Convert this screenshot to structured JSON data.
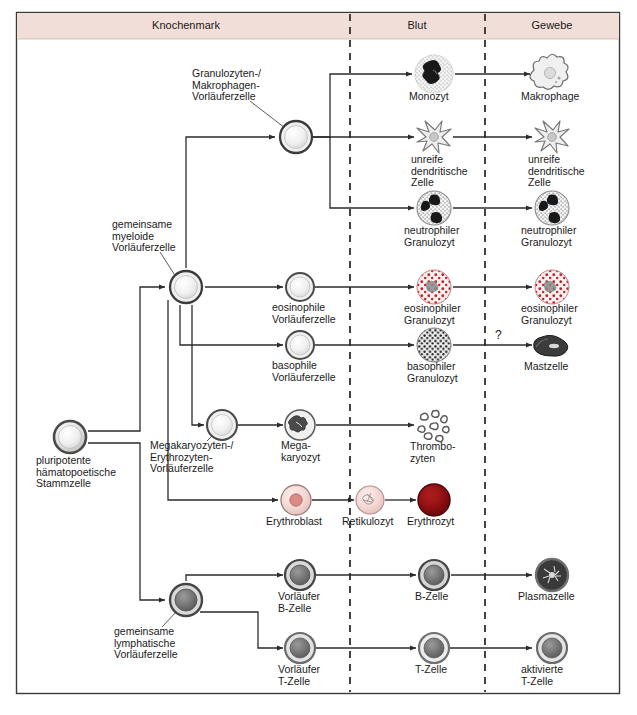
{
  "figure": {
    "frame": {
      "x": 16,
      "y": 12,
      "w": 604,
      "h": 682,
      "border_color": "#3a3a3a"
    },
    "header_band": {
      "fill": "#f2ded8",
      "height": 26
    }
  },
  "columns": [
    {
      "name": "Knochenmark",
      "label": "Knochenmark",
      "center_x": 186
    },
    {
      "name": "Blut",
      "label": "Blut",
      "center_x": 417
    },
    {
      "name": "Gewebe",
      "label": "Gewebe",
      "center_x": 552
    }
  ],
  "dividers": [
    350,
    485
  ],
  "colors": {
    "cell_light": "#d8d8d8",
    "cell_rim": "#9a9a9a",
    "cell_dark": "#6f6f6f",
    "eosinophil_red": "#c0272d",
    "erythrocyte_red": "#8e0f12",
    "erythroblast_pink": "#f2d3d0",
    "line": "#2b2b2b",
    "header_band": "#f2ded8"
  },
  "cells": [
    {
      "id": "stem",
      "label": "pluripotente\nhämatopoetische\nStammzelle",
      "x": 70,
      "y": 437,
      "r": 16,
      "kind": "grad-gray",
      "label_x": 36,
      "label_y": 461,
      "align": "left"
    },
    {
      "id": "gm-prog",
      "label": "Granulozyten-/\nMakrophagen-\nVorläuferzelle",
      "x": 296,
      "y": 137,
      "r": 16,
      "kind": "ring-light",
      "label_x": 192,
      "label_y": 74,
      "align": "left"
    },
    {
      "id": "myeloid",
      "label": "gemeinsame\nmyeloide\nVorläuferzelle",
      "x": 186,
      "y": 287,
      "r": 16,
      "kind": "ring-light",
      "label_x": 112,
      "label_y": 225,
      "align": "left"
    },
    {
      "id": "eos-prog",
      "label": "eosinophile\nVorläuferzelle",
      "x": 300,
      "y": 287,
      "r": 14,
      "kind": "ring-light",
      "label_x": 272,
      "label_y": 305,
      "align": "left"
    },
    {
      "id": "bas-prog",
      "label": "basophile\nVorläuferzelle",
      "x": 300,
      "y": 345,
      "r": 14,
      "kind": "ring-light",
      "label_x": 272,
      "label_y": 363,
      "align": "left"
    },
    {
      "id": "mk-prog",
      "label": "Megakaryozyten-/\nErythrozyten-\nVorläuferzelle",
      "x": 222,
      "y": 425,
      "r": 15,
      "kind": "ring-light",
      "label_x": 150,
      "label_y": 443,
      "align": "left"
    },
    {
      "id": "megakaryo",
      "label": "Mega-\nkaryozyt",
      "x": 300,
      "y": 425,
      "r": 15,
      "kind": "megakaryocyte",
      "label_x": 280,
      "label_y": 443,
      "align": "left"
    },
    {
      "id": "erythroblast",
      "label": "Erythroblast",
      "x": 296,
      "y": 500,
      "r": 15,
      "kind": "erythroblast",
      "label_x": 268,
      "label_y": 519,
      "align": "left"
    },
    {
      "id": "lymphoid",
      "label": "gemeinsame\nlymphatische\nVorläuferzelle",
      "x": 186,
      "y": 600,
      "r": 16,
      "kind": "ring-dark",
      "label_x": 114,
      "label_y": 630,
      "align": "left"
    },
    {
      "id": "pre-b",
      "label": "Vorläufer\nB-Zelle",
      "x": 300,
      "y": 575,
      "r": 15,
      "kind": "ring-dark",
      "label_x": 278,
      "label_y": 593,
      "align": "left"
    },
    {
      "id": "pre-t",
      "label": "Vorläufer\nT-Zelle",
      "x": 300,
      "y": 648,
      "r": 15,
      "kind": "ring-dark",
      "label_x": 278,
      "label_y": 666,
      "align": "left"
    },
    {
      "id": "monozyt",
      "label": "Monozyt",
      "x": 434,
      "y": 74,
      "r": 19,
      "kind": "monocyte",
      "label_x": 408,
      "label_y": 94,
      "align": "left"
    },
    {
      "id": "idc-blood",
      "label": "unreife\ndendritische\nZelle",
      "x": 434,
      "y": 137,
      "r": 17,
      "kind": "dendritic",
      "label_x": 410,
      "label_y": 157,
      "align": "left"
    },
    {
      "id": "neutro-blood",
      "label": "neutrophiler\nGranulozyt",
      "x": 434,
      "y": 208,
      "r": 17,
      "kind": "neutrophil",
      "label_x": 404,
      "label_y": 228,
      "align": "left"
    },
    {
      "id": "eos-blood",
      "label": "eosinophiler\nGranulozyt",
      "x": 434,
      "y": 287,
      "r": 17,
      "kind": "eosinophil",
      "label_x": 404,
      "label_y": 306,
      "align": "left"
    },
    {
      "id": "bas-blood",
      "label": "basophiler\nGranulozyt",
      "x": 434,
      "y": 345,
      "r": 17,
      "kind": "basophil",
      "label_x": 406,
      "label_y": 364,
      "align": "left"
    },
    {
      "id": "thrombo",
      "label": "Thrombo-\nzyten",
      "x": 434,
      "y": 425,
      "r": 17,
      "kind": "platelets",
      "label_x": 409,
      "label_y": 444,
      "align": "left"
    },
    {
      "id": "retikulozyt",
      "label": "Retikulozyt",
      "x": 370,
      "y": 500,
      "r": 14,
      "kind": "reticulocyte",
      "label_x": 342,
      "label_y": 519,
      "align": "left"
    },
    {
      "id": "erythrozyt",
      "label": "Erythrozyt",
      "x": 434,
      "y": 500,
      "r": 16,
      "kind": "erythrocyte",
      "label_x": 408,
      "label_y": 519,
      "align": "left"
    },
    {
      "id": "b-zelle",
      "label": "B-Zelle",
      "x": 434,
      "y": 575,
      "r": 15,
      "kind": "ring-dark",
      "label_x": 414,
      "label_y": 594,
      "align": "left"
    },
    {
      "id": "t-zelle",
      "label": "T-Zelle",
      "x": 434,
      "y": 648,
      "r": 15,
      "kind": "ring-dark",
      "label_x": 414,
      "label_y": 667,
      "align": "left"
    },
    {
      "id": "makrophage",
      "label": "Makrophage",
      "x": 552,
      "y": 74,
      "r": 19,
      "kind": "macrophage",
      "label_x": 521,
      "label_y": 94,
      "align": "left"
    },
    {
      "id": "idc-tissue",
      "label": "unreife\ndendritische\nZelle",
      "x": 552,
      "y": 137,
      "r": 17,
      "kind": "dendritic",
      "label_x": 527,
      "label_y": 157,
      "align": "left"
    },
    {
      "id": "neutro-tissue",
      "label": "neutrophiler\nGranulozyt",
      "x": 552,
      "y": 208,
      "r": 17,
      "kind": "neutrophil",
      "label_x": 521,
      "label_y": 228,
      "align": "left"
    },
    {
      "id": "eos-tissue",
      "label": "eosinophiler\nGranulozyt",
      "x": 552,
      "y": 287,
      "r": 17,
      "kind": "eosinophil",
      "label_x": 521,
      "label_y": 306,
      "align": "left"
    },
    {
      "id": "mastzelle",
      "label": "Mastzelle",
      "x": 552,
      "y": 345,
      "r": 17,
      "kind": "mastcell",
      "label_x": 523,
      "label_y": 364,
      "align": "left"
    },
    {
      "id": "plasmazelle",
      "label": "Plasmazelle",
      "x": 552,
      "y": 575,
      "r": 16,
      "kind": "plasmacell",
      "label_x": 518,
      "label_y": 594,
      "align": "left"
    },
    {
      "id": "akt-t",
      "label": "aktivierte\nT-Zelle",
      "x": 552,
      "y": 648,
      "r": 15,
      "kind": "ring-dark",
      "label_x": 521,
      "label_y": 666,
      "align": "left"
    }
  ],
  "annotations": [
    {
      "id": "mast-question",
      "text": "?",
      "x": 495,
      "y": 335
    }
  ],
  "leader_lines": [
    {
      "from_label": "gm-prog",
      "x1": 250,
      "y1": 100,
      "x2": 284,
      "y2": 127
    },
    {
      "from_label": "myeloid",
      "x1": 158,
      "y1": 251,
      "x2": 175,
      "y2": 277
    },
    {
      "from_label": "mk-prog",
      "x1": 206,
      "y1": 440,
      "x2": 216,
      "y2": 432
    },
    {
      "from_label": "lymphoid",
      "x1": 160,
      "y1": 626,
      "x2": 177,
      "y2": 610
    },
    {
      "from_label": "stem",
      "x1": 0,
      "y1": 0,
      "x2": 0,
      "y2": 0
    }
  ]
}
